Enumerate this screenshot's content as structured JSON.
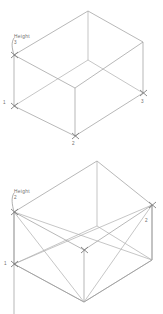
{
  "document": {
    "kind": "isometric-wireframe-diagram",
    "background_color": "#ffffff",
    "line_color": "#9a9a9a",
    "text_color": "#6d6d6d",
    "figure_count": 2
  },
  "figures": [
    {
      "id": "figure-top",
      "name": "isometric-box-top",
      "height_label": {
        "caption": "Height",
        "value": "3"
      },
      "vertex_labels": [
        {
          "name": "vertex-label-1",
          "text": "1"
        },
        {
          "name": "vertex-label-2",
          "text": "2"
        },
        {
          "name": "vertex-label-3",
          "text": "3"
        }
      ]
    },
    {
      "id": "figure-bottom",
      "name": "isometric-box-bottom",
      "height_label": {
        "caption": "Height",
        "value": "2"
      },
      "vertex_labels": [
        {
          "name": "vertex-label-1",
          "text": "1"
        },
        {
          "name": "vertex-label-2",
          "text": "2"
        }
      ]
    }
  ]
}
